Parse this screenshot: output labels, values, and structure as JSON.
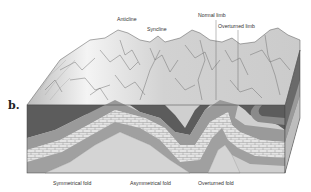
{
  "figure": {
    "panel_label": "b.",
    "top_labels": {
      "anticline": "Anticline",
      "syncline": "Syncline",
      "normal_limb": "Normal limb",
      "overturned_limb": "Overturned limb"
    },
    "bottom_labels": {
      "symmetrical": "Symmetrical fold",
      "asymmetrical": "Asymmetrical fold",
      "overturned": "Overturned fold"
    },
    "colors": {
      "background": "#ffffff",
      "terrain": "#d6d6d6",
      "terrain_highlight": "#f2f2f2",
      "dark_layer": "#5c5c5c",
      "mid_layer": "#9a9a9a",
      "limestone": "#e2e2e2",
      "core": "#cfcfcf",
      "line": "#444444"
    }
  }
}
